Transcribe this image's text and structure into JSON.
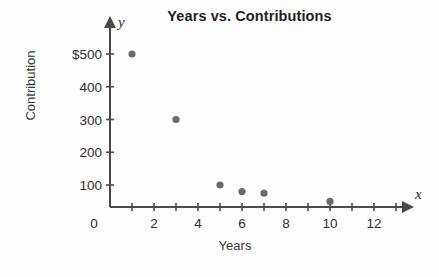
{
  "chart_data": {
    "type": "scatter",
    "title": "Years vs. Contributions",
    "xlabel": "Years",
    "ylabel": "Contribution",
    "x_axis_letter": "x",
    "y_axis_letter": "y",
    "origin_label": "0",
    "grid": false,
    "legend": "none",
    "xlim": [
      0,
      13
    ],
    "ylim": [
      0,
      550
    ],
    "x_ticks_all": [
      1,
      2,
      3,
      4,
      5,
      6,
      7,
      8,
      9,
      10,
      11,
      12,
      13
    ],
    "x_tick_labels": [
      {
        "value": 2,
        "label": "2"
      },
      {
        "value": 4,
        "label": "4"
      },
      {
        "value": 6,
        "label": "6"
      },
      {
        "value": 8,
        "label": "8"
      },
      {
        "value": 10,
        "label": "10"
      },
      {
        "value": 12,
        "label": "12"
      }
    ],
    "y_tick_labels": [
      {
        "value": 100,
        "label": "100"
      },
      {
        "value": 200,
        "label": "200"
      },
      {
        "value": 300,
        "label": "300"
      },
      {
        "value": 400,
        "label": "400"
      },
      {
        "value": 500,
        "label": "$500"
      }
    ],
    "points": [
      {
        "x": 1,
        "y": 500
      },
      {
        "x": 3,
        "y": 300
      },
      {
        "x": 5,
        "y": 100
      },
      {
        "x": 6,
        "y": 80
      },
      {
        "x": 7,
        "y": 75
      },
      {
        "x": 10,
        "y": 50
      }
    ],
    "marker_color": "#6b6b6b",
    "axis_color": "#4a4a4a",
    "background_color": "#fdfdfd",
    "title_color": "#1f1f1f"
  }
}
